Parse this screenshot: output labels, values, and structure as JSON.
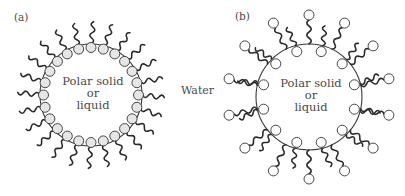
{
  "figure": {
    "width": 405,
    "height": 196,
    "medium_label": "Water",
    "medium_label_pos": [
      181,
      94
    ],
    "colors": {
      "line": "#3a3a3a",
      "tail": "#2a2a2a",
      "head_fill_a": "#e6e6e6",
      "head_fill_b": "#ffffff",
      "text": "#4a4a4a"
    }
  },
  "panels": [
    {
      "id": "a",
      "label": "(a)",
      "label_pos": [
        14,
        21
      ],
      "core": {
        "cx": 91,
        "cy": 95,
        "r": 51
      },
      "core_text": [
        "Polar solid",
        "or",
        "liquid"
      ],
      "arrangement": "heads-inward",
      "description": "Surfactant monolayer: polar heads adsorbed on the polar core, hydrocarbon tails pointing outward into water",
      "molecules": {
        "count": 24,
        "head_r": 5,
        "tail_len": 22,
        "start_angle_deg": -90
      }
    },
    {
      "id": "b",
      "label": "(b)",
      "label_pos": [
        235,
        20
      ],
      "core": {
        "cx": 309,
        "cy": 97,
        "r": 53
      },
      "core_text": [
        "Polar solid",
        "or",
        "liquid"
      ],
      "arrangement": "bilayer",
      "description": "Second layer adsorbed tail-to-tail: inner heads on the core, outer heads facing water",
      "molecules": {
        "inner_count": 12,
        "inner_start_angle_deg": -75,
        "outer_count": 14,
        "outer_start_angle_deg": -90,
        "head_r": 5,
        "tail_len": 20
      }
    }
  ]
}
